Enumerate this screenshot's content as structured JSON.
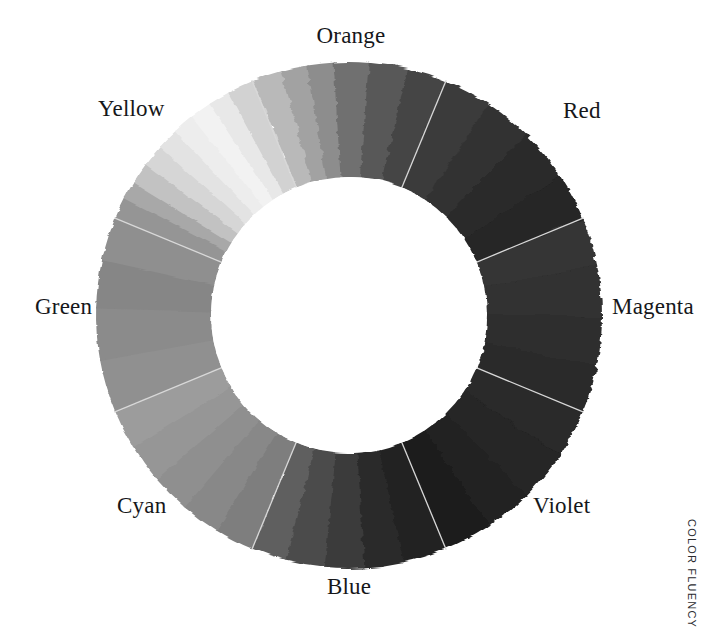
{
  "page": {
    "background": "#ffffff",
    "watermark": "COLOR FLUENCY",
    "label_color": "#16171a",
    "divider_color": "#d8d8d8"
  },
  "chart_data": {
    "type": "pie",
    "subtitle": "",
    "xlabel": "",
    "ylabel": "",
    "legend_position": "around-ring",
    "grid": false,
    "donut": true,
    "center": {
      "x": 349,
      "y": 315
    },
    "outer_radius": 253,
    "inner_radius": 138,
    "start_angle_deg": -112.5,
    "slice_count": 8,
    "categories": [
      "Orange",
      "Red",
      "Magenta",
      "Violet",
      "Blue",
      "Cyan",
      "Green",
      "Yellow"
    ],
    "values": [
      12.5,
      12.5,
      12.5,
      12.5,
      12.5,
      12.5,
      12.5,
      12.5
    ],
    "series": [
      {
        "name": "Hue sectors (grayscale luminance)",
        "values": [
          12.5,
          12.5,
          12.5,
          12.5,
          12.5,
          12.5,
          12.5,
          12.5
        ]
      }
    ],
    "slices": [
      {
        "label": "Orange",
        "start_deg": -112.5,
        "end_deg": -67.5,
        "share_pct": 12.5,
        "base_gray": "#4a4a4a",
        "label_pos": {
          "x": 351,
          "y": 38
        },
        "label_align": "center",
        "steps": [
          {
            "gray": "#b9b9b9",
            "span_deg": 7
          },
          {
            "gray": "#a2a2a2",
            "span_deg": 6
          },
          {
            "gray": "#8d8d8d",
            "span_deg": 6
          },
          {
            "gray": "#6f6f6f",
            "span_deg": 8
          },
          {
            "gray": "#585858",
            "span_deg": 9
          },
          {
            "gray": "#444444",
            "span_deg": 9
          }
        ]
      },
      {
        "label": "Red",
        "start_deg": -67.5,
        "end_deg": -22.5,
        "share_pct": 12.5,
        "base_gray": "#2c2c2c",
        "label_pos": {
          "x": 563,
          "y": 113
        },
        "label_align": "left",
        "steps": [
          {
            "gray": "#3a3a3a",
            "span_deg": 11
          },
          {
            "gray": "#333333",
            "span_deg": 11
          },
          {
            "gray": "#2b2b2b",
            "span_deg": 12
          },
          {
            "gray": "#252525",
            "span_deg": 11
          }
        ]
      },
      {
        "label": "Magenta",
        "start_deg": -22.5,
        "end_deg": 22.5,
        "share_pct": 12.5,
        "base_gray": "#2f2f2f",
        "label_pos": {
          "x": 612,
          "y": 309
        },
        "label_align": "left",
        "steps": [
          {
            "gray": "#343434",
            "span_deg": 11
          },
          {
            "gray": "#303030",
            "span_deg": 12
          },
          {
            "gray": "#2d2d2d",
            "span_deg": 11
          },
          {
            "gray": "#2a2a2a",
            "span_deg": 11
          }
        ]
      },
      {
        "label": "Violet",
        "start_deg": 22.5,
        "end_deg": 67.5,
        "share_pct": 12.5,
        "base_gray": "#242424",
        "label_pos": {
          "x": 533,
          "y": 508
        },
        "label_align": "left",
        "steps": [
          {
            "gray": "#292929",
            "span_deg": 11
          },
          {
            "gray": "#252525",
            "span_deg": 12
          },
          {
            "gray": "#212121",
            "span_deg": 11
          },
          {
            "gray": "#1d1d1d",
            "span_deg": 11
          }
        ]
      },
      {
        "label": "Blue",
        "start_deg": 67.5,
        "end_deg": 112.5,
        "share_pct": 12.5,
        "base_gray": "#343434",
        "label_pos": {
          "x": 349,
          "y": 589
        },
        "label_align": "center",
        "steps": [
          {
            "gray": "#232323",
            "span_deg": 10
          },
          {
            "gray": "#2b2b2b",
            "span_deg": 9
          },
          {
            "gray": "#3a3a3a",
            "span_deg": 9
          },
          {
            "gray": "#4c4c4c",
            "span_deg": 9
          },
          {
            "gray": "#5e5e5e",
            "span_deg": 8
          }
        ]
      },
      {
        "label": "Cyan",
        "start_deg": 112.5,
        "end_deg": 157.5,
        "share_pct": 12.5,
        "base_gray": "#8f8f8f",
        "label_pos": {
          "x": 117,
          "y": 508
        },
        "label_align": "left",
        "steps": [
          {
            "gray": "#7e7e7e",
            "span_deg": 9
          },
          {
            "gray": "#888888",
            "span_deg": 9
          },
          {
            "gray": "#8f8f8f",
            "span_deg": 9
          },
          {
            "gray": "#969696",
            "span_deg": 9
          },
          {
            "gray": "#9c9c9c",
            "span_deg": 9
          }
        ]
      },
      {
        "label": "Green",
        "start_deg": 157.5,
        "end_deg": 202.5,
        "share_pct": 12.5,
        "base_gray": "#898989",
        "label_pos": {
          "x": 35,
          "y": 309
        },
        "label_align": "left",
        "steps": [
          {
            "gray": "#909090",
            "span_deg": 12
          },
          {
            "gray": "#8b8b8b",
            "span_deg": 12
          },
          {
            "gray": "#868686",
            "span_deg": 11
          },
          {
            "gray": "#8f8f8f",
            "span_deg": 10
          }
        ]
      },
      {
        "label": "Yellow",
        "start_deg": 202.5,
        "end_deg": 247.5,
        "share_pct": 12.5,
        "base_gray": "#e4e4e4",
        "label_pos": {
          "x": 98,
          "y": 111
        },
        "label_align": "left",
        "steps": [
          {
            "gray": "#959595",
            "span_deg": 5
          },
          {
            "gray": "#a8a8a8",
            "span_deg": 4
          },
          {
            "gray": "#c2c2c2",
            "span_deg": 5
          },
          {
            "gray": "#d6d6d6",
            "span_deg": 5
          },
          {
            "gray": "#e3e3e3",
            "span_deg": 5
          },
          {
            "gray": "#ededed",
            "span_deg": 5
          },
          {
            "gray": "#f2f2f2",
            "span_deg": 5
          },
          {
            "gray": "#e8e8e8",
            "span_deg": 5
          },
          {
            "gray": "#d2d2d2",
            "span_deg": 6
          }
        ]
      }
    ]
  }
}
